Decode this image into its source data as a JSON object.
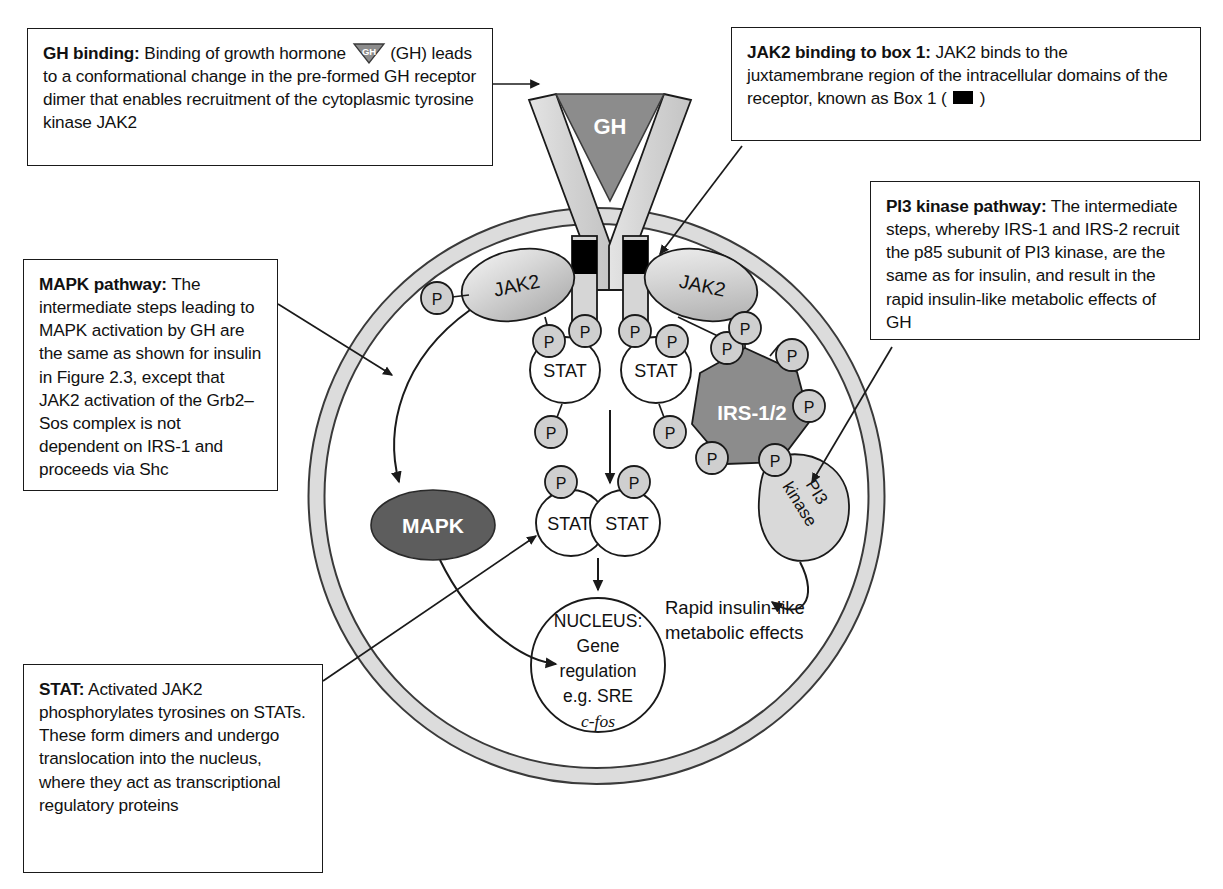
{
  "captions": {
    "gh_binding": {
      "lead": "GH binding:",
      "text_before_chip": " Binding of growth hormone ",
      "text_after_chip": " (GH) leads to a conformational change in the pre-formed GH receptor dimer that enables recruitment of the cytoplasmic tyrosine kinase JAK2",
      "chip_label": "GH"
    },
    "jak2_box1": {
      "lead": "JAK2 binding to box 1:",
      "text_before_chip": " JAK2 binds to the juxtamembrane region of the intracellular domains of the receptor, known as Box 1 ( ",
      "text_after_chip": " )"
    },
    "pi3_kinase": {
      "lead": "PI3 kinase pathway:",
      "text": " The intermediate steps, whereby IRS-1 and IRS-2 recruit the p85 subunit of PI3 kinase, are the same as for insulin, and result in the rapid insulin-like metabolic effects of GH"
    },
    "mapk_pathway": {
      "lead": "MAPK pathway:",
      "text": " The intermediate steps leading to MAPK activation by GH are the same as shown for insulin in Figure 2.3, except that JAK2 activation of the Grb2–Sos complex is not dependent on IRS-1 and proceeds via Shc"
    },
    "stat": {
      "lead": "STAT:",
      "text": " Activated JAK2 phosphorylates tyrosines on STATs. These form dimers and undergo translocation into the nucleus, where they act as transcriptional regulatory proteins"
    }
  },
  "diagram": {
    "hormone_label": "GH",
    "kinase_left_label": "JAK2",
    "kinase_right_label": "JAK2",
    "stat_label": "STAT",
    "stat_monomer_left": "STAT",
    "stat_monomer_right": "STAT",
    "stat_dimer_left": "STAT",
    "stat_dimer_right": "STAT",
    "irs_label": "IRS-1/2",
    "pi3_label_line1": "PI3",
    "pi3_label_line2": "kinase",
    "mapk_label": "MAPK",
    "phosphate_label": "P",
    "nucleus_line1": "NUCLEUS:",
    "nucleus_line2": "Gene",
    "nucleus_line3": "regulation",
    "nucleus_line4": "e.g. SRE",
    "nucleus_line5": "c-fos",
    "effects_line1": "Rapid insulin-like",
    "effects_line2": "metabolic effects",
    "phosphate_count": 14
  },
  "colors": {
    "membrane_fill": "#dcdcdc",
    "membrane_stroke": "#3a3a3a",
    "hormone_fill": "#8c8c8c",
    "receptor_fill": "#d6d6d6",
    "box1_fill": "#000000",
    "jak2_fill": "#cfcfcf",
    "irs_fill": "#8c8c8c",
    "mapk_fill": "#5d5d5d",
    "pi3_fill": "#d9d9d9",
    "phosphate_fill": "#cfcfcf",
    "stat_fill": "#ffffff",
    "outline": "#1a1a1a",
    "text": "#111111",
    "background": "#ffffff"
  }
}
